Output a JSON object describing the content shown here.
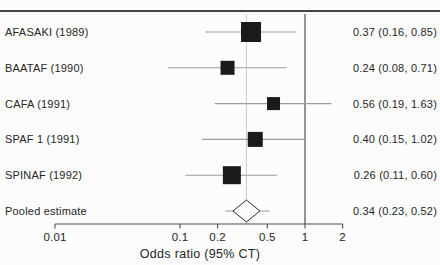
{
  "colors": {
    "background": "#fcfcfc",
    "rule": "#424242",
    "text": "#262626",
    "square": "#1a1a1a",
    "ci_line": "#9c9c9c",
    "axis_line": "#4d4d4d",
    "ref_line": "#4d4d4d",
    "pooled_line": "#c9c9c9",
    "diamond_fill": "#fcfcfc",
    "diamond_stroke": "#2b2b2b"
  },
  "chart_data": {
    "type": "forest",
    "title": "",
    "xlabel": "Odds ratio (95% CT)",
    "ylabel": "",
    "x_scale": "log",
    "xlim": [
      0.01,
      2
    ],
    "x_ticks": [
      0.01,
      0.1,
      0.2,
      0.5,
      1,
      2
    ],
    "x_tick_labels": [
      "0.01",
      "0.1",
      "0.2",
      "0.5",
      "1",
      "2"
    ],
    "ref_line": 1,
    "pooled_reference_line": 0.34,
    "grid": false,
    "studies": [
      {
        "label": "AFASAKI (1989)",
        "or": 0.37,
        "ci_low": 0.16,
        "ci_high": 0.85,
        "display": "0.37 (0.16, 0.85)",
        "marker_px": 20
      },
      {
        "label": "BAATAF (1990)",
        "or": 0.24,
        "ci_low": 0.08,
        "ci_high": 0.71,
        "display": "0.24 (0.08, 0.71)",
        "marker_px": 14
      },
      {
        "label": "CAFA (1991)",
        "or": 0.56,
        "ci_low": 0.19,
        "ci_high": 1.63,
        "display": "0.56 (0.19, 1.63)",
        "marker_px": 13
      },
      {
        "label": "SPAF 1 (1991)",
        "or": 0.4,
        "ci_low": 0.15,
        "ci_high": 1.02,
        "display": "0.40 (0.15, 1.02)",
        "marker_px": 15
      },
      {
        "label": "SPINAF (1992)",
        "or": 0.26,
        "ci_low": 0.11,
        "ci_high": 0.6,
        "display": "0.26 (0.11, 0.60)",
        "marker_px": 18
      }
    ],
    "pooled": {
      "label": "Pooled estimate",
      "or": 0.34,
      "ci_low": 0.23,
      "ci_high": 0.52,
      "display": "0.34 (0.23, 0.52)",
      "diamond_w_px": 27,
      "diamond_h_px": 22
    }
  }
}
